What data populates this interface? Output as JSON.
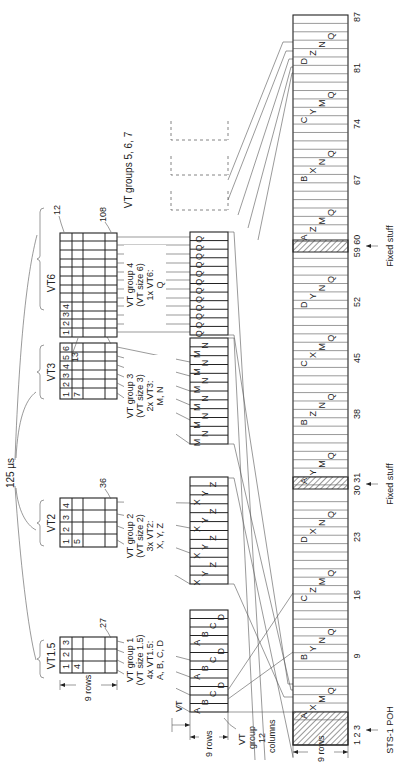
{
  "diagram": {
    "period_label": "125 µs",
    "rows_label": "9 rows",
    "vt_label": "VT",
    "vt_group_label": "VT group 12 columns",
    "vt_group_label_lines": [
      "VT",
      "group",
      "12",
      "columns"
    ],
    "vt_groups_5_6_7_label": "VT groups 5, 6, 7",
    "fixed_stuff_label": "Fixed stuff",
    "sts1_poh_label": "STS-1 POH",
    "vts": [
      {
        "name": "VT1.5",
        "header_row1": [
          "1",
          "2",
          "3"
        ],
        "header_row2": [
          "4"
        ],
        "end_label": "27"
      },
      {
        "name": "VT2",
        "header_row1": [
          "1",
          "2",
          "3",
          "4"
        ],
        "header_row2": [
          "5"
        ],
        "end_label": "36"
      },
      {
        "name": "VT3",
        "header_row1": [
          "1",
          "2",
          "3",
          "4",
          "5",
          "6"
        ],
        "header_row2": [
          "7"
        ],
        "end_label": "54"
      },
      {
        "name": "VT6",
        "header_row1": [
          "1",
          "2",
          "3",
          "4"
        ],
        "header_row2": [],
        "start_label": "13",
        "top_label": "12",
        "end_label": "108"
      }
    ],
    "vt_groups": [
      {
        "lines": [
          "VT group 1",
          "(VT size 1.5)",
          "4x VT1.5:",
          "A, B, C, D"
        ],
        "columns": [
          "A",
          "B",
          "C",
          "D",
          "A",
          "B",
          "C",
          "D",
          "A",
          "B",
          "C",
          "D"
        ]
      },
      {
        "lines": [
          "VT group 2",
          "(VT size 2)",
          "3x VT2:",
          "X, Y, Z"
        ],
        "columns": [
          "X",
          "Y",
          "Z",
          "X",
          "Y",
          "Z",
          "X",
          "Y",
          "Z",
          "X",
          "Y",
          "Z"
        ]
      },
      {
        "lines": [
          "VT group 3",
          "(VT size 3)",
          "2x VT3:",
          "M, N"
        ],
        "columns": [
          "M",
          "N",
          "M",
          "N",
          "M",
          "N",
          "M",
          "N",
          "M",
          "N",
          "M",
          "N"
        ]
      },
      {
        "lines": [
          "VT group 4",
          "(VT size 6)",
          "1x VT6:",
          "Q"
        ],
        "columns": [
          "Q",
          "Q",
          "Q",
          "Q",
          "Q",
          "Q",
          "Q",
          "Q",
          "Q",
          "Q",
          "Q",
          "Q"
        ]
      }
    ],
    "sts1_frame": {
      "column_labels": [
        "1 2 3",
        "9",
        "16",
        "23",
        "30 31",
        "38",
        "45",
        "52",
        "59 60",
        "67",
        "74",
        "81",
        "87"
      ],
      "segments": [
        {
          "labels": [
            "A",
            "X",
            "M",
            "Q"
          ]
        },
        {
          "labels": [
            "B",
            "Y",
            "N",
            "Q"
          ]
        },
        {
          "labels": [
            "C",
            "Z",
            "M",
            "Q"
          ]
        },
        {
          "labels": [
            "D",
            "X",
            "N",
            "Q"
          ]
        },
        {
          "labels": [
            "A",
            "Y",
            "M",
            "Q"
          ]
        },
        {
          "labels": [
            "B",
            "Z",
            "N",
            "Q"
          ]
        },
        {
          "labels": [
            "C",
            "X",
            "M",
            "Q"
          ]
        },
        {
          "labels": [
            "D",
            "Y",
            "N",
            "Q"
          ]
        },
        {
          "labels": [
            "A",
            "Z",
            "M",
            "Q"
          ]
        },
        {
          "labels": [
            "B",
            "X",
            "N",
            "Q"
          ]
        },
        {
          "labels": [
            "C",
            "Y",
            "M",
            "Q"
          ]
        },
        {
          "labels": [
            "D",
            "Z",
            "N",
            "Q"
          ]
        }
      ]
    }
  }
}
